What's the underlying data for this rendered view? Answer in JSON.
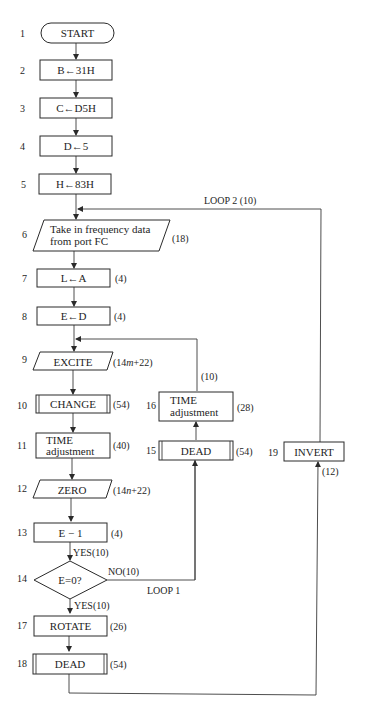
{
  "diagram": {
    "type": "flowchart",
    "nodes": [
      {
        "id": "1",
        "num": "1",
        "shape": "terminator",
        "label": "START",
        "cost": ""
      },
      {
        "id": "2",
        "num": "2",
        "shape": "process",
        "label": "B←31H",
        "cost": ""
      },
      {
        "id": "3",
        "num": "3",
        "shape": "process",
        "label": "C←D5H",
        "cost": ""
      },
      {
        "id": "4",
        "num": "4",
        "shape": "process",
        "label": "D←5",
        "cost": ""
      },
      {
        "id": "5",
        "num": "5",
        "shape": "process",
        "label": "H←83H",
        "cost": ""
      },
      {
        "id": "6",
        "num": "6",
        "shape": "io",
        "label_line1": "Take in frequency data",
        "label_line2": "from port FC",
        "cost": "(18)"
      },
      {
        "id": "7",
        "num": "7",
        "shape": "process",
        "label": "L←A",
        "cost": "(4)"
      },
      {
        "id": "8",
        "num": "8",
        "shape": "process",
        "label": "E←D",
        "cost": "(4)"
      },
      {
        "id": "9",
        "num": "9",
        "shape": "io",
        "label": "EXCITE",
        "cost_prefix": "(14",
        "cost_var": "m",
        "cost_suffix": "+22)"
      },
      {
        "id": "10",
        "num": "10",
        "shape": "subroutine",
        "label": "CHANGE",
        "cost": "(54)"
      },
      {
        "id": "11",
        "num": "11",
        "shape": "process",
        "label_line1": "TIME",
        "label_line2": "adjustment",
        "cost": "(40)"
      },
      {
        "id": "12",
        "num": "12",
        "shape": "io",
        "label": "ZERO",
        "cost_prefix": "(14",
        "cost_var": "n",
        "cost_suffix": "+22)"
      },
      {
        "id": "13",
        "num": "13",
        "shape": "process",
        "label": "E − 1",
        "cost": "(4)"
      },
      {
        "id": "14",
        "num": "14",
        "shape": "decision",
        "label": "E=0?",
        "cost": ""
      },
      {
        "id": "15",
        "num": "15",
        "shape": "subroutine",
        "label": "DEAD",
        "cost": "(54)"
      },
      {
        "id": "16",
        "num": "16",
        "shape": "process",
        "label_line1": "TIME",
        "label_line2": "adjustment",
        "cost": "(28)"
      },
      {
        "id": "17",
        "num": "17",
        "shape": "process",
        "label": "ROTATE",
        "cost": "(26)"
      },
      {
        "id": "18",
        "num": "18",
        "shape": "subroutine",
        "label": "DEAD",
        "cost": "(54)"
      },
      {
        "id": "19",
        "num": "19",
        "shape": "process",
        "label": "INVERT",
        "cost": "(12)"
      }
    ],
    "edge_labels": {
      "e13_14": "YES(10)",
      "e14_no": "NO(10)",
      "e14_yes": "YES(10)",
      "loop1": "LOOP 1",
      "loop1_cost": "(10)",
      "loop2": "LOOP 2 (10)"
    },
    "edges": [
      [
        "1",
        "2"
      ],
      [
        "2",
        "3"
      ],
      [
        "3",
        "4"
      ],
      [
        "4",
        "5"
      ],
      [
        "5",
        "6"
      ],
      [
        "6",
        "7"
      ],
      [
        "7",
        "8"
      ],
      [
        "8",
        "9"
      ],
      [
        "9",
        "10"
      ],
      [
        "10",
        "11"
      ],
      [
        "11",
        "12"
      ],
      [
        "12",
        "13"
      ],
      [
        "13",
        "14"
      ],
      [
        "14",
        "17"
      ],
      [
        "14",
        "15"
      ],
      [
        "15",
        "16"
      ],
      [
        "16",
        "9"
      ],
      [
        "17",
        "18"
      ],
      [
        "18",
        "19"
      ],
      [
        "19",
        "6"
      ]
    ]
  }
}
